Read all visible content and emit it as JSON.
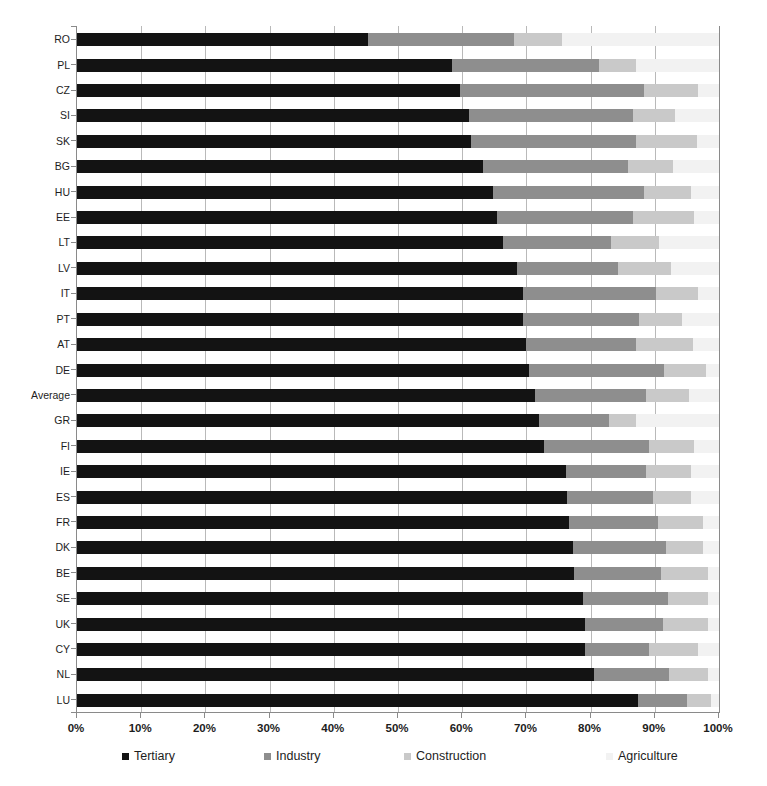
{
  "chart_data": {
    "type": "bar",
    "orientation": "horizontal",
    "stacked": true,
    "normalized": true,
    "title": "",
    "subtitle": "",
    "xlabel": "",
    "ylabel": "",
    "xlim": [
      0,
      100
    ],
    "xunit": "%",
    "grid": true,
    "legend_position": "bottom",
    "tick_labels": [
      "0%",
      "10%",
      "20%",
      "30%",
      "40%",
      "50%",
      "60%",
      "70%",
      "80%",
      "90%",
      "100%"
    ],
    "tick_values": [
      0,
      10,
      20,
      30,
      40,
      50,
      60,
      70,
      80,
      90,
      100
    ],
    "categories": [
      "RO",
      "PL",
      "CZ",
      "SI",
      "SK",
      "BG",
      "HU",
      "EE",
      "LT",
      "LV",
      "IT",
      "PT",
      "AT",
      "DE",
      "Average",
      "GR",
      "FI",
      "IE",
      "ES",
      "FR",
      "DK",
      "BE",
      "SE",
      "UK",
      "CY",
      "NL",
      "LU"
    ],
    "series": [
      {
        "name": "Tertiary",
        "color": "#131313",
        "values": [
          45.3,
          58.4,
          59.7,
          61.0,
          61.4,
          63.2,
          64.8,
          65.4,
          66.4,
          68.5,
          69.5,
          69.5,
          69.9,
          70.4,
          71.3,
          72.0,
          72.7,
          76.2,
          76.3,
          76.6,
          77.3,
          77.4,
          78.8,
          79.1,
          79.1,
          80.5,
          87.4
        ]
      },
      {
        "name": "Industry",
        "color": "#8e8e8e",
        "values": [
          22.7,
          22.9,
          28.6,
          25.6,
          25.6,
          22.6,
          23.5,
          21.2,
          16.8,
          15.8,
          20.7,
          18.0,
          17.1,
          21.0,
          17.3,
          10.9,
          16.4,
          12.4,
          13.4,
          13.9,
          14.4,
          13.6,
          13.3,
          12.2,
          10.0,
          11.7,
          7.6
        ]
      },
      {
        "name": "Construction",
        "color": "#c9c9c9",
        "values": [
          7.6,
          5.8,
          8.4,
          6.5,
          9.5,
          7.0,
          7.3,
          9.5,
          7.5,
          8.3,
          6.5,
          6.8,
          8.9,
          6.5,
          6.7,
          4.2,
          7.0,
          7.0,
          5.9,
          7.0,
          5.8,
          7.3,
          6.2,
          7.0,
          7.6,
          6.1,
          3.7
        ]
      },
      {
        "name": "Agriculture",
        "color": "#f2f2f2",
        "values": [
          24.4,
          12.9,
          3.3,
          6.9,
          3.5,
          7.2,
          4.4,
          3.9,
          9.3,
          7.4,
          3.3,
          5.7,
          4.1,
          2.1,
          4.7,
          12.9,
          3.9,
          4.4,
          4.4,
          2.5,
          2.5,
          1.7,
          1.7,
          1.7,
          3.3,
          1.7,
          1.3
        ]
      }
    ]
  },
  "axis": {
    "x_tick_labels": [
      "0%",
      "10%",
      "20%",
      "30%",
      "40%",
      "50%",
      "60%",
      "70%",
      "80%",
      "90%",
      "100%"
    ],
    "y_tick_labels": [
      "RO",
      "PL",
      "CZ",
      "SI",
      "SK",
      "BG",
      "HU",
      "EE",
      "LT",
      "LV",
      "IT",
      "PT",
      "AT",
      "DE",
      "Average",
      "GR",
      "FI",
      "IE",
      "ES",
      "FR",
      "DK",
      "BE",
      "SE",
      "UK",
      "CY",
      "NL",
      "LU"
    ]
  },
  "legend": {
    "items": [
      {
        "label": "Tertiary",
        "color": "#131313"
      },
      {
        "label": "Industry",
        "color": "#8e8e8e"
      },
      {
        "label": "Construction",
        "color": "#c9c9c9"
      },
      {
        "label": "Agriculture",
        "color": "#f2f2f2"
      }
    ]
  },
  "colors": {
    "tertiary": "#131313",
    "industry": "#8e8e8e",
    "construction": "#c9c9c9",
    "agriculture": "#f2f2f2",
    "gridline": "#b9b9b9",
    "axis": "#8a8a8a",
    "background": "#ffffff",
    "text": "#1d1d1d"
  }
}
